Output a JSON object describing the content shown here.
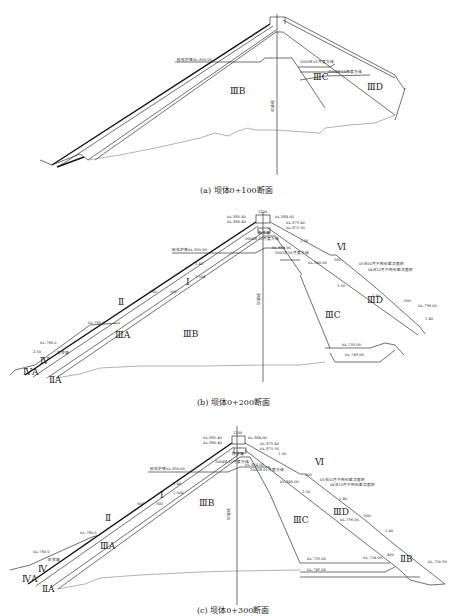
{
  "sections": [
    {
      "id": "a",
      "caption": "(a) 坝体0+100断面",
      "zones": [
        "ⅢB",
        "ⅢC",
        "ⅢD"
      ],
      "labels": {
        "slope_protection": "砂浆护坡EL.850.00",
        "line_2005_01": "2005年01月度方线",
        "line_2004_12": "2004年12月度方线",
        "axis": "坝轴线"
      }
    },
    {
      "id": "b",
      "caption": "(b) 坝体0+200断面",
      "zones": [
        "Ⅰ",
        "Ⅱ",
        "ⅢA",
        "ⅢB",
        "ⅢC",
        "ⅢD",
        "Ⅳ",
        "ⅣA",
        "ⅡA",
        "Ⅵ"
      ],
      "labels": {
        "crest_width": "1200",
        "el_885": "EL.885.40",
        "el_880": "EL.880.40",
        "el_884": "EL.884.00",
        "el_879": "EL.879.40",
        "el_875": "EL.875.50",
        "el_874": "EL.874.00",
        "el_854": "EL.854.00",
        "el_840": "EL.840.00",
        "el_796": "EL.796.00",
        "el_780": "EL.780.0",
        "el_760": "EL.760.0",
        "el_759": "EL.759.00",
        "el_749": "EL.749.00",
        "slope_protection": "砂浆护坡EL.850.00",
        "line_2004_12": "2004年12月度方线",
        "line_2005_01": "2005年01月度方线",
        "rockfill_2005_01": "05年01月干砌石截流面积",
        "rockfill_2004_12": "04年12月干砌石截流面积",
        "axis": "坝轴线",
        "slope_140": "1.40",
        "slope_150": "1.50",
        "slope_1504": "1.504",
        "slope_250": "2.50",
        "berm_500": "500",
        "one": "1",
        "cutoff": "防渗墙"
      }
    },
    {
      "id": "c",
      "caption": "(c) 坝体0+300断面",
      "zones": [
        "Ⅰ",
        "Ⅱ",
        "ⅢA",
        "ⅢB",
        "ⅢC",
        "ⅢD",
        "Ⅳ",
        "ⅣA",
        "ⅡA",
        "ⅡB",
        "Ⅵ"
      ],
      "labels": {
        "crest_width": "1200",
        "el_885": "EL.885.40",
        "el_880": "EL.880.40",
        "el_884": "EL.884.00",
        "el_879": "EL.879.40",
        "el_875": "EL.875.50",
        "el_854": "EL.854.00",
        "el_840": "EL.840.00",
        "el_796": "EL.796.00",
        "el_780": "EL.780.0",
        "el_760": "EL.760.0",
        "el_759": "EL.759.00",
        "el_754": "EL.754.00",
        "el_750": "EL.750.90",
        "el_749": "EL.749.00",
        "slope_protection": "砂浆护坡EL.850.00",
        "line_2004_12": "2004年12月度方线",
        "line_2005_01": "2005年01月度方线",
        "rockfill_2005_01": "05年01月干砌石截流面积",
        "rockfill_2004_12": "04年12月干砌石截流面积",
        "axis": "坝轴线",
        "slope_140": "1.40",
        "slope_150": "1.50",
        "slope_1504": "1.504",
        "berm_500": "500",
        "berm_400": "400",
        "one": "1",
        "cutoff": "防渗墙"
      }
    }
  ]
}
